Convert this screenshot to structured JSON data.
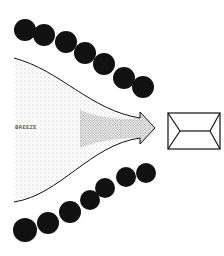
{
  "diagram": {
    "labels": {
      "breeze": "BREEZE"
    },
    "colors": {
      "ink": "#111111",
      "stipple": "#555555",
      "background": "#ffffff"
    },
    "top_tree_row": [
      [
        25,
        30
      ],
      [
        44,
        35
      ],
      [
        66,
        42
      ],
      [
        85,
        53
      ],
      [
        104,
        64
      ],
      [
        124,
        78
      ],
      [
        143,
        87
      ]
    ],
    "bottom_tree_row": [
      [
        25,
        230
      ],
      [
        48,
        223
      ],
      [
        70,
        212
      ],
      [
        90,
        200
      ],
      [
        105,
        188
      ],
      [
        126,
        177
      ],
      [
        146,
        173
      ]
    ],
    "building": {
      "type": "hip-roof-plan",
      "x": 168,
      "y": 113,
      "w": 52,
      "h": 36
    }
  }
}
